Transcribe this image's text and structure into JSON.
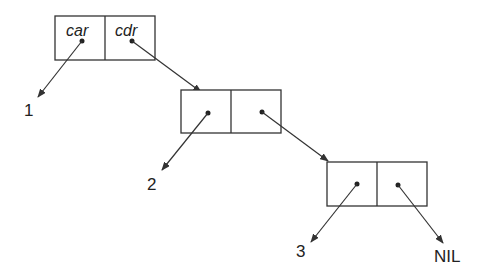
{
  "diagram": {
    "cell_headers": {
      "car": "car",
      "cdr": "cdr"
    },
    "cells": [
      {
        "id": "cell-1",
        "car_value": "1"
      },
      {
        "id": "cell-2",
        "car_value": "2"
      },
      {
        "id": "cell-3",
        "car_value": "3",
        "cdr_value": "NIL"
      }
    ],
    "labels": {
      "one": "1",
      "two": "2",
      "three": "3",
      "nil": "NIL"
    },
    "colors": {
      "stroke": "#333333",
      "background": "#ffffff"
    }
  }
}
